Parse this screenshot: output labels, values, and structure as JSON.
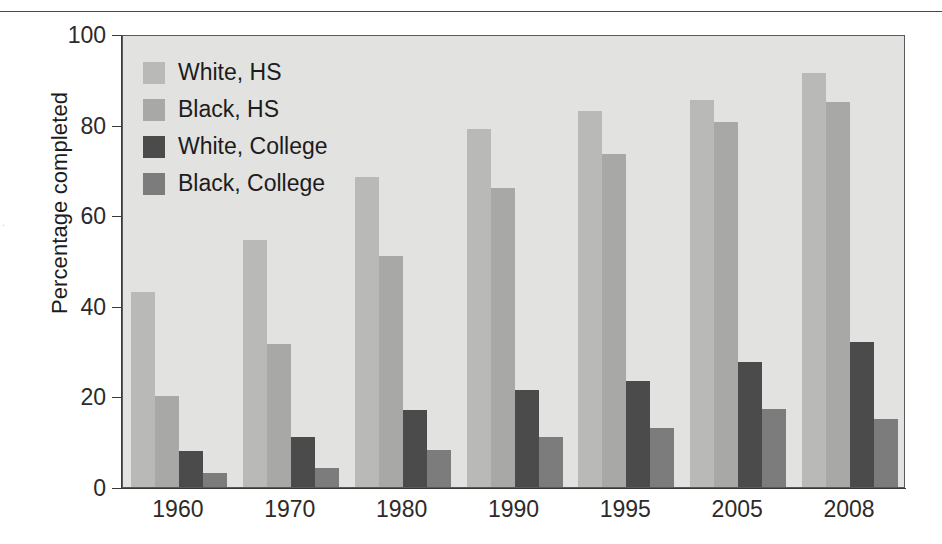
{
  "figure": {
    "edge_artifact_text": ".",
    "background_color": "#ffffff",
    "plot_background_color": "#e2e2e0"
  },
  "chart_data": {
    "type": "bar",
    "title": "",
    "xlabel": "",
    "ylabel": "Percentage completed",
    "categories": [
      "1960",
      "1970",
      "1980",
      "1990",
      "1995",
      "2005",
      "2008"
    ],
    "series": [
      {
        "name": "White, HS",
        "color": "#b9b9b7",
        "values": [
          43,
          54.5,
          68.5,
          79,
          83,
          85.5,
          91.5
        ]
      },
      {
        "name": "Black, HS",
        "color": "#a8a8a6",
        "values": [
          20,
          31.5,
          51,
          66,
          73.5,
          80.5,
          85
        ]
      },
      {
        "name": "White, College",
        "color": "#4b4b4b",
        "values": [
          8,
          11,
          17,
          21.5,
          23.5,
          27.5,
          32
        ]
      },
      {
        "name": "Black, College",
        "color": "#7c7c7c",
        "values": [
          3,
          4.2,
          8.2,
          11,
          13,
          17.3,
          15
        ]
      }
    ],
    "ylim": [
      0,
      100
    ],
    "yticks": [
      0,
      20,
      40,
      60,
      80,
      100
    ],
    "ytick_labels": [
      "0",
      "20",
      "40",
      "60",
      "80",
      "100"
    ],
    "grid": false,
    "legend_position": "upper left inside plot"
  },
  "legend": {
    "items": [
      {
        "label": "White, HS",
        "color": "#b9b9b7"
      },
      {
        "label": "Black, HS",
        "color": "#a8a8a6"
      },
      {
        "label": "White, College",
        "color": "#4b4b4b"
      },
      {
        "label": "Black, College",
        "color": "#7c7c7c"
      }
    ]
  }
}
